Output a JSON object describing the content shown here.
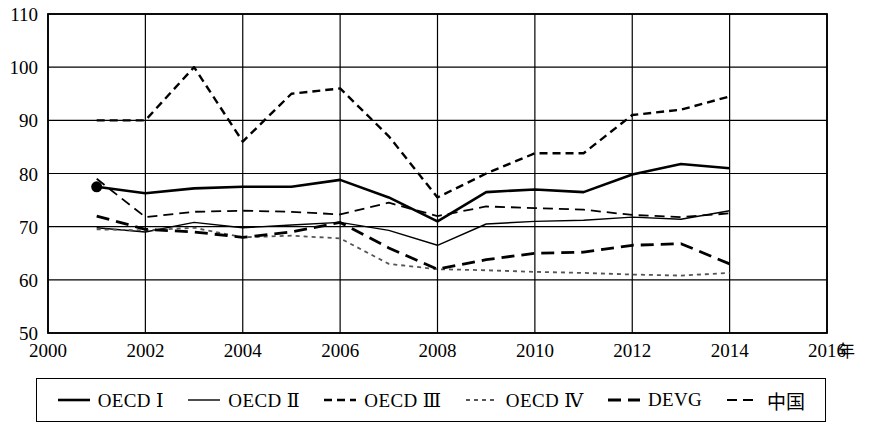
{
  "chart_data": {
    "type": "line",
    "title": "",
    "xlabel": "年",
    "ylabel": "",
    "xlim": [
      2000,
      2016
    ],
    "ylim": [
      50,
      110
    ],
    "grid": true,
    "legend_position": "bottom",
    "x_ticks": [
      "2000",
      "2002",
      "2004",
      "2006",
      "2008",
      "2010",
      "2012",
      "2014",
      "2016"
    ],
    "y_ticks": [
      "50",
      "60",
      "70",
      "80",
      "90",
      "100",
      "110"
    ],
    "x": [
      2001,
      2002,
      2003,
      2004,
      2005,
      2006,
      2007,
      2008,
      2009,
      2010,
      2011,
      2012,
      2013,
      2014
    ],
    "series": [
      {
        "name": "OECD Ⅰ",
        "style": "solid-thick",
        "color": "#000000",
        "marker_start": true,
        "values": [
          77.5,
          76.3,
          77.2,
          77.5,
          77.5,
          78.8,
          75.5,
          71.0,
          76.5,
          77.0,
          76.5,
          79.8,
          81.8,
          81.0
        ]
      },
      {
        "name": "OECD Ⅱ",
        "style": "solid-thin",
        "color": "#000000",
        "marker_start": false,
        "values": [
          69.8,
          69.0,
          70.8,
          69.8,
          70.3,
          70.8,
          69.3,
          66.5,
          70.5,
          71.0,
          71.2,
          71.8,
          71.4,
          73.0
        ]
      },
      {
        "name": "OECD Ⅲ",
        "style": "dashed-med",
        "color": "#000000",
        "marker_start": false,
        "values": [
          90.0,
          90.0,
          100.0,
          86.0,
          95.0,
          96.0,
          87.0,
          75.5,
          80.0,
          83.8,
          83.8,
          91.0,
          92.0,
          94.5
        ]
      },
      {
        "name": "OECD Ⅳ",
        "style": "dotted-fine",
        "color": "#555555",
        "marker_start": false,
        "values": [
          69.5,
          69.3,
          69.8,
          68.0,
          68.3,
          67.8,
          63.0,
          62.0,
          61.8,
          61.5,
          61.3,
          61.0,
          60.8,
          61.3
        ]
      },
      {
        "name": "DEVG",
        "style": "dashed-long-thick",
        "color": "#000000",
        "marker_start": false,
        "values": [
          72.0,
          69.5,
          69.0,
          68.0,
          69.0,
          70.8,
          66.0,
          62.0,
          63.8,
          65.0,
          65.2,
          66.5,
          66.8,
          63.0
        ]
      },
      {
        "name": "中国",
        "style": "dashed-short",
        "color": "#000000",
        "marker_start": false,
        "values": [
          79.0,
          71.8,
          72.8,
          73.0,
          72.8,
          72.3,
          74.5,
          72.0,
          73.8,
          73.5,
          73.2,
          72.2,
          71.8,
          72.5
        ]
      }
    ]
  },
  "axis": {
    "x_unit_label": "年"
  },
  "legend": {
    "items": [
      {
        "label": "OECD Ⅰ",
        "style": "solid-thick"
      },
      {
        "label": "OECD Ⅱ",
        "style": "solid-thin"
      },
      {
        "label": "OECD Ⅲ",
        "style": "dashed-med"
      },
      {
        "label": "OECD Ⅳ",
        "style": "dotted-fine"
      },
      {
        "label": "DEVG",
        "style": "dashed-long-thick"
      },
      {
        "label": "中国",
        "style": "dashed-short"
      }
    ]
  }
}
